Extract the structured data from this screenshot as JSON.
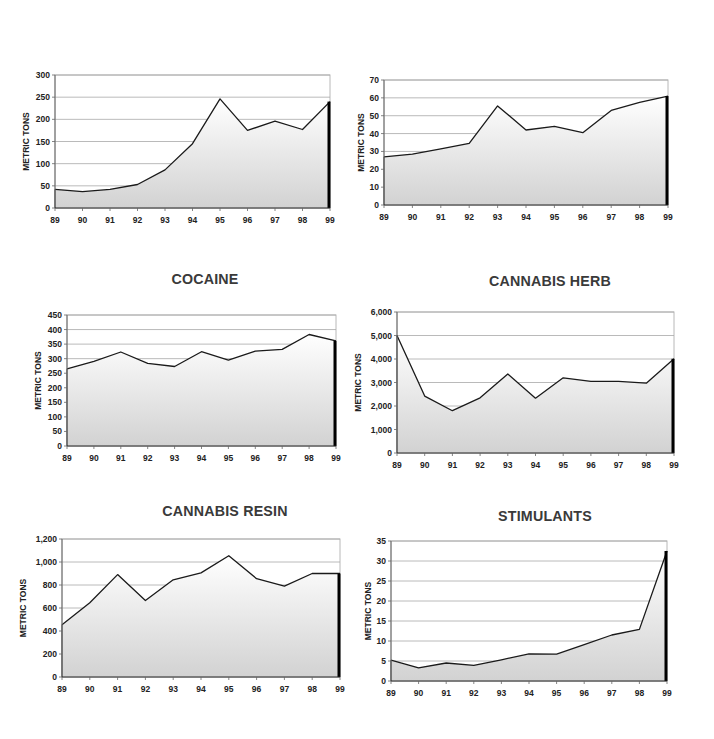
{
  "chart_data": [
    {
      "type": "area",
      "title": "OPIUM",
      "xlabel": "",
      "ylabel": "METRIC TONS",
      "x": [
        "89",
        "90",
        "91",
        "92",
        "93",
        "94",
        "95",
        "96",
        "97",
        "98",
        "99"
      ],
      "values": [
        42,
        37,
        42,
        53,
        86,
        145,
        246,
        175,
        196,
        177,
        240
      ],
      "ylim": [
        0,
        300
      ],
      "yticks": [
        0,
        50,
        100,
        150,
        200,
        250,
        300
      ],
      "ytick_labels": [
        "0",
        "50",
        "100",
        "150",
        "200",
        "250",
        "300"
      ],
      "grid": true
    },
    {
      "type": "area",
      "title": "HEROIN & MORPHINE",
      "xlabel": "",
      "ylabel": "METRIC TONS",
      "x": [
        "89",
        "90",
        "91",
        "92",
        "93",
        "94",
        "95",
        "96",
        "97",
        "98",
        "99"
      ],
      "values": [
        27,
        28.5,
        31.5,
        34.5,
        55.5,
        42,
        44,
        40.5,
        53,
        57.5,
        61
      ],
      "ylim": [
        0,
        70
      ],
      "yticks": [
        0,
        10,
        20,
        30,
        40,
        50,
        60,
        70
      ],
      "ytick_labels": [
        "0",
        "10",
        "20",
        "30",
        "40",
        "50",
        "60",
        "70"
      ],
      "grid": true
    },
    {
      "type": "area",
      "title": "COCAINE",
      "xlabel": "",
      "ylabel": "METRIC TONS",
      "x": [
        "89",
        "90",
        "91",
        "92",
        "93",
        "94",
        "95",
        "96",
        "97",
        "98",
        "99"
      ],
      "values": [
        265,
        291,
        323,
        284,
        273,
        324,
        295,
        326,
        332,
        383,
        361
      ],
      "ylim": [
        0,
        450
      ],
      "yticks": [
        0,
        50,
        100,
        150,
        200,
        250,
        300,
        350,
        400,
        450
      ],
      "ytick_labels": [
        "0",
        "50",
        "100",
        "150",
        "200",
        "250",
        "300",
        "350",
        "400",
        "450"
      ],
      "grid": true
    },
    {
      "type": "area",
      "title": "CANNABIS HERB",
      "xlabel": "",
      "ylabel": "METRIC TONS",
      "x": [
        "89",
        "90",
        "91",
        "92",
        "93",
        "94",
        "95",
        "96",
        "97",
        "98",
        "99"
      ],
      "values": [
        5000,
        2420,
        1800,
        2350,
        3360,
        2330,
        3200,
        3050,
        3050,
        2970,
        4010
      ],
      "ylim": [
        0,
        6000
      ],
      "yticks": [
        0,
        1000,
        2000,
        3000,
        4000,
        5000,
        6000
      ],
      "ytick_labels": [
        "0",
        "1,000",
        "2,000",
        "3,000",
        "4,000",
        "5,000",
        "6,000"
      ],
      "grid": true
    },
    {
      "type": "area",
      "title": "CANNABIS RESIN",
      "xlabel": "",
      "ylabel": "METRIC TONS",
      "x": [
        "89",
        "90",
        "91",
        "92",
        "93",
        "94",
        "95",
        "96",
        "97",
        "98",
        "99"
      ],
      "values": [
        455,
        645,
        890,
        665,
        845,
        905,
        1055,
        855,
        790,
        900,
        900
      ],
      "ylim": [
        0,
        1200
      ],
      "yticks": [
        0,
        200,
        400,
        600,
        800,
        1000,
        1200
      ],
      "ytick_labels": [
        "0",
        "200",
        "400",
        "600",
        "800",
        "1,000",
        "1,200"
      ],
      "grid": true
    },
    {
      "type": "area",
      "title": "STIMULANTS",
      "xlabel": "",
      "ylabel": "METRIC TONS",
      "x": [
        "89",
        "90",
        "91",
        "92",
        "93",
        "94",
        "95",
        "96",
        "97",
        "98",
        "99"
      ],
      "values": [
        5.2,
        3.3,
        4.5,
        3.9,
        5.3,
        6.8,
        6.7,
        9.1,
        11.5,
        12.9,
        32.5
      ],
      "ylim": [
        0,
        35
      ],
      "yticks": [
        0,
        5,
        10,
        15,
        20,
        25,
        30,
        35
      ],
      "ytick_labels": [
        "0",
        "5",
        "10",
        "15",
        "20",
        "25",
        "30",
        "35"
      ],
      "grid": true
    }
  ]
}
